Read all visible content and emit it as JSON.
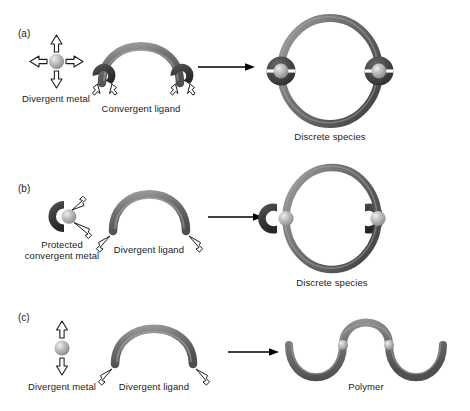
{
  "figure": {
    "background_color": "#ffffff",
    "colors": {
      "ligand_gray": "#6e6e6e",
      "ligand_gray_light": "#9a9a9a",
      "ligand_gray_dark": "#4d4d4d",
      "metal_sphere": "#b3b3b3",
      "metal_sphere_highlight": "#e2e2e2",
      "protecting_group_dark": "#3a3a3a",
      "arrow_black": "#000000",
      "text": "#1a1a1a"
    }
  },
  "panels": [
    {
      "tag": "(a)",
      "reactant_metal": {
        "label": "Divergent metal",
        "icon": "sphere-with-four-outward-arrows",
        "arrow_directions": [
          "up",
          "down",
          "left",
          "right"
        ],
        "arrow_style": "hollow-outline"
      },
      "reactant_ligand": {
        "label": "Convergent ligand",
        "icon": "arch-with-two-converging-claw-ends",
        "arrow_count": 4,
        "arrow_style": "hollow-outline"
      },
      "reaction_arrow": "right-arrow",
      "product": {
        "label": "Discrete species",
        "icon": "oval-macrocycle-with-two-metal-nodes",
        "node_count": 2
      }
    },
    {
      "tag": "(b)",
      "reactant_metal": {
        "label_line_1": "Protected",
        "label_line_2": "convergent metal",
        "icon": "crescent-shield-with-sphere",
        "arrow_count": 2,
        "arrow_style": "hollow-outline-inward"
      },
      "reactant_ligand": {
        "label": "Divergent ligand",
        "icon": "plain-arch",
        "arrow_count": 2,
        "arrow_style": "hollow-outline"
      },
      "reaction_arrow": "right-arrow",
      "product": {
        "label": "Discrete species",
        "icon": "oval-macrocycle-with-two-protected-metal-nodes",
        "node_count": 2
      }
    },
    {
      "tag": "(c)",
      "reactant_metal": {
        "label": "Divergent metal",
        "icon": "sphere-with-two-vertical-arrows",
        "arrow_directions": [
          "up",
          "down"
        ],
        "arrow_style": "hollow-outline"
      },
      "reactant_ligand": {
        "label": "Divergent ligand",
        "icon": "plain-arch",
        "arrow_count": 2,
        "arrow_style": "hollow-outline"
      },
      "reaction_arrow": "right-arrow",
      "product": {
        "label": "Polymer",
        "icon": "sinusoidal-chain-with-metal-nodes",
        "node_count": 2
      }
    }
  ]
}
